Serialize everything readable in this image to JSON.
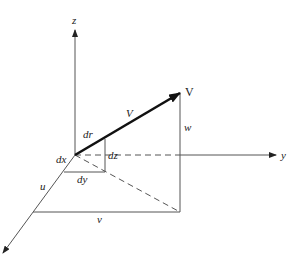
{
  "diagram": {
    "title": "",
    "axes": {
      "z": {
        "label": "z"
      },
      "y": {
        "label": "y"
      },
      "x": {
        "label": ""
      }
    },
    "vector": {
      "label_tip": "V",
      "label_mid": "V"
    },
    "labels": {
      "dr": "dr",
      "dx": "dx",
      "dy": "dy",
      "dz": "dz",
      "u": "u",
      "v": "v",
      "w": "w"
    },
    "colors": {
      "line": "#555555",
      "vector": "#111111",
      "background": "#ffffff"
    }
  }
}
